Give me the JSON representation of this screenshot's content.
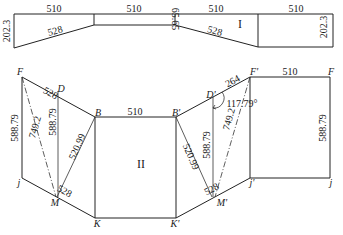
{
  "diagram": {
    "part_labels": {
      "top": "I",
      "bottom": "II"
    },
    "top_strip": {
      "segment_lengths": [
        "510",
        "510",
        "510",
        "510"
      ],
      "slant_lengths": [
        "528",
        "528"
      ],
      "left_height": "202.3",
      "right_height": "202.3",
      "middle_height": "65.65"
    },
    "bottom_development": {
      "points": {
        "F_left": "F",
        "D": "D",
        "B": "B",
        "j_left": "j",
        "M": "M",
        "K": "K",
        "B_prime": "B'",
        "D_prime": "D'",
        "F_prime": "F'",
        "F_right": "F",
        "j_prime": "j'",
        "M_prime": "M'",
        "K_prime": "K'",
        "j_right": "j"
      },
      "left": {
        "FD": "528",
        "Fj": "588.79",
        "D_vertical": "588.79",
        "FM": "749.2",
        "BM": "520.99",
        "jM": "528"
      },
      "center": {
        "BB_prime": "510"
      },
      "right": {
        "D_prime_F_prime": "264",
        "angle": "117.79°",
        "D_prime_vertical": "588.79",
        "F_prime_M_prime": "749.2",
        "B_prime_M_prime": "520.99",
        "M_prime_j_prime": "528",
        "F_prime_F": "510",
        "F_j": "588.79"
      }
    }
  }
}
